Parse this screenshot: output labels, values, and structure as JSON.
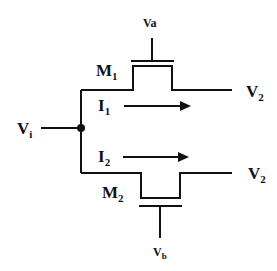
{
  "diagram": {
    "type": "circuit",
    "input": {
      "label": "V",
      "sub": "i"
    },
    "transistors": [
      {
        "label": "M",
        "sub": "1",
        "gate": {
          "label": "Va"
        },
        "output": {
          "label": "V",
          "sub": "2"
        },
        "current": {
          "label": "I",
          "sub": "1"
        }
      },
      {
        "label": "M",
        "sub": "2",
        "gate": {
          "label": "V",
          "sub": "b"
        },
        "output": {
          "label": "V",
          "sub": "2"
        },
        "current": {
          "label": "I",
          "sub": "2"
        }
      }
    ],
    "colors": {
      "line": "#111111",
      "background": "#ffffff"
    }
  }
}
